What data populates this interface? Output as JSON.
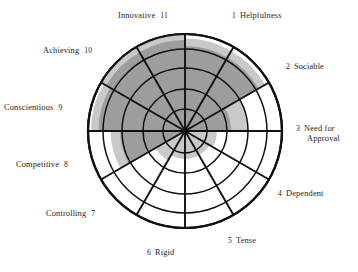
{
  "figure": {
    "title": "",
    "background_color": "#ffffff",
    "outline_color": "#111111"
  },
  "colors": {
    "outline": "#111111",
    "profile_fill": "#9d9d9d",
    "halo_fill": "#c9c9c9",
    "background": "#ffffff",
    "text": "#1c1c1c"
  },
  "labels": {
    "s1": {
      "num": "1",
      "name": "Helpfulness",
      "name2": ""
    },
    "s2": {
      "num": "2",
      "name": "Sociable",
      "name2": ""
    },
    "s3": {
      "num": "3",
      "name": "Need for",
      "name2": "Approval"
    },
    "s4": {
      "num": "4",
      "name": "Dependent",
      "name2": ""
    },
    "s5": {
      "num": "5",
      "name": "Tense",
      "name2": ""
    },
    "s6": {
      "num": "6",
      "name": "Rigid",
      "name2": ""
    },
    "s7": {
      "num": "7",
      "name": "Controlling",
      "name2": ""
    },
    "s8": {
      "num": "8",
      "name": "Competitive",
      "name2": ""
    },
    "s9": {
      "num": "9",
      "name": "Conscientious",
      "name2": ""
    },
    "s10": {
      "num": "10",
      "name": "Achieving",
      "name2": ""
    },
    "s11": {
      "num": "11",
      "name": "Innovative",
      "name2": ""
    }
  },
  "chart_data": {
    "type": "radar",
    "title": "",
    "subtitle": "",
    "xlabel": "",
    "ylabel": "",
    "grid": true,
    "legend_position": "none",
    "geometry": {
      "center_x": 185,
      "center_y": 131,
      "outer_radius": 97,
      "sector_count": 12,
      "ring_radii": [
        22,
        42,
        63,
        82,
        97
      ],
      "ring_count": 5,
      "sector_start_angle_deg": -90,
      "sector_span_deg": 30
    },
    "categories": [
      "1 Helpfulness",
      "2 Sociable",
      "3 Need for Approval",
      "4 Dependent",
      "5 Tense",
      "6 Rigid",
      "7 Controlling",
      "8 Competitive",
      "9 Conscientious",
      "10 Achieving",
      "11 Innovative",
      "12"
    ],
    "series": [
      {
        "name": "Profile (inner dark band)",
        "color": "#9d9d9d",
        "units": "ring index (0-5)",
        "values": [
          4.2,
          4.2,
          2.2,
          0.0,
          0.0,
          0.0,
          0.0,
          0.0,
          3.1,
          4.3,
          4.6,
          4.6
        ]
      },
      {
        "name": "Halo (outer light band)",
        "color": "#c9c9c9",
        "units": "ring index (0-5)",
        "values": [
          4.7,
          4.7,
          3.0,
          1.5,
          1.3,
          1.3,
          1.3,
          1.6,
          3.6,
          4.8,
          5.0,
          5.0
        ]
      }
    ],
    "ylim": [
      0,
      5
    ],
    "annotations": []
  }
}
